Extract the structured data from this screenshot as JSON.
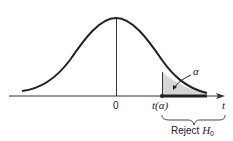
{
  "diagram": {
    "type": "t-distribution one-tailed rejection region",
    "origin_label": "0",
    "critical_label": "t(α)",
    "axis_label": "t",
    "area_label": "α",
    "region_label_prefix": "Reject ",
    "region_label_var": "H",
    "region_label_sub": "0",
    "colors": {
      "curve": "#222222",
      "shade": "#d6d6d6",
      "axis": "#333333"
    }
  }
}
